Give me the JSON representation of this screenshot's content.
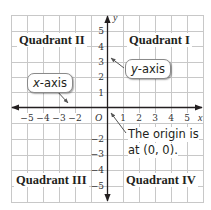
{
  "diagram": {
    "type": "coordinate-plane",
    "grid": {
      "x_min": -6,
      "x_max": 6,
      "y_min": -6,
      "y_max": 6,
      "cell_px": 16
    },
    "axes": {
      "x_label": "x",
      "y_label": "y",
      "origin_label": "O",
      "x_ticks_negative": [
        "−5",
        "−4",
        "−3",
        "−2"
      ],
      "x_ticks_positive": [
        "1",
        "2",
        "3",
        "4",
        "5"
      ],
      "y_ticks_positive": [
        "5",
        "4",
        "3",
        "2",
        "1"
      ],
      "y_ticks_negative": [
        "−2",
        "−3",
        "−4",
        "−5"
      ]
    },
    "quadrants": {
      "q1": "Quadrant I",
      "q2": "Quadrant II",
      "q3": "Quadrant III",
      "q4": "Quadrant IV"
    },
    "callouts": {
      "x_axis_italic": "x",
      "x_axis_rest": "-axis",
      "y_axis_italic": "y",
      "y_axis_rest": "-axis",
      "origin_line1": "The origin is",
      "origin_line2": "at (0, 0)."
    },
    "colors": {
      "grid": "#c8c8c8",
      "axis": "#231f20",
      "pointer": "#555555",
      "callout_border": "#8a8a8a"
    }
  }
}
